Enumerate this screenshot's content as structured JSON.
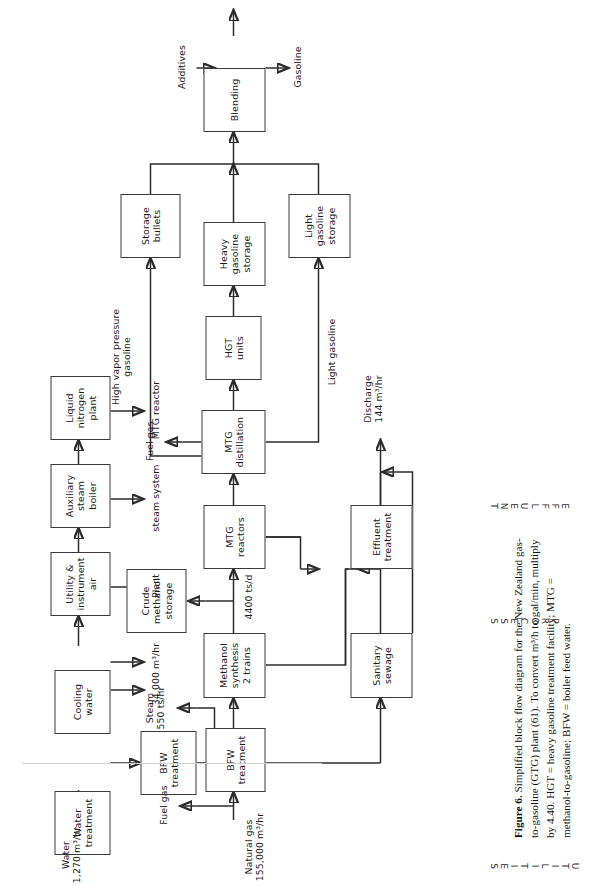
{
  "figure": {
    "caption_label": "Figure 6.",
    "caption_line1": "Simplified block flow diagram for the New Zealand gas-to-gasoline (GTG) plant",
    "caption_line2": "(61). To convert m³/h to gal/min, multiply by 4.40.",
    "caption_line3": "HGT = heavy gasoline treatment facility; MTG = methanol-to-gasoline; BFW = boiler",
    "caption_line4": "feed water."
  },
  "bands": {
    "utilities": "UTILITIES",
    "process": "PROCESS",
    "effluent": "EFFLUENT"
  },
  "boxes": {
    "water_treatment": "Water\ntreatment",
    "cooling_water": "Cooling\nwater",
    "utility_instrument_air": "Utility &\ninstrument\nair",
    "auxiliary_steam_boiler": "Auxiliary\nsteam\nboiler",
    "liquid_nitrogen_plant": "Liquid\nnitrogen\nplant",
    "bfw_treatment_util": "BFW\ntreatment",
    "bfw_treatment_proc": "BFW\ntreatment",
    "methanol_synthesis": "Methanol\nsynthesis\n2 trains",
    "crude_methanol_storage": "Crude\nmethanol\nstorage",
    "mtg_reactors": "MTG\nreactors",
    "mtg_distillation": "MTG\ndistillation",
    "hgt_units": "HGT\nunits",
    "storage_bullets": "Storage\nbullets",
    "heavy_gasoline_storage": "Heavy\ngasoline\nstorage",
    "light_gasoline_storage": "Light\ngasoline\nstorage",
    "blending": "Blending",
    "sanitary_sewage": "Sanitary\nsewage",
    "effluent_treatment": "Effluent\ntreatment"
  },
  "stream_labels": {
    "water_in": "Water\n1,270 m³/hr",
    "cooling_water_out": "34,000   m³/hr",
    "air_to_plant": "Plant",
    "steam_system": "steam system",
    "mtg_reactor_out": "MTG reactor",
    "steam_550": "Steam\n550 ts/hr",
    "fuel_gas_bfw": "Fuel gas",
    "natural_gas_in": "Natural gas\n155,000 m³/hr",
    "methanol_rate": "4400 ts/d",
    "fuel_gas_mtg": "Fuel gas",
    "high_vapor_pressure_gasoline": "High vapor pressure\ngasoline",
    "light_gasoline": "Light gasoline",
    "additives": "Additives",
    "gasoline_out": "Gasoline",
    "discharge": "Discharge\n144 m³/hr"
  }
}
